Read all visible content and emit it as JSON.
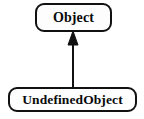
{
  "diagram": {
    "type": "uml-class-diagram",
    "background_color": "#ffffff",
    "stroke_color": "#111111",
    "text_color": "#0b0b0b",
    "fill_color": "#fdfdfd",
    "classes": [
      {
        "id": "object",
        "name": "Object",
        "shape": "rounded-rectangle",
        "x": 35,
        "y": 3,
        "width": 77,
        "height": 29
      },
      {
        "id": "undefinedobject",
        "name": "UndefinedObject",
        "shape": "rounded-rectangle",
        "x": 8,
        "y": 87,
        "width": 129,
        "height": 25
      }
    ],
    "relationships": [
      {
        "id": "generalization-1",
        "kind": "generalization",
        "label": "",
        "from": "UndefinedObject",
        "to": "Object",
        "arrowhead": "solid-filled-triangle",
        "line_style": "solid",
        "x": 73,
        "y_start": 87,
        "y_end": 31
      }
    ]
  }
}
